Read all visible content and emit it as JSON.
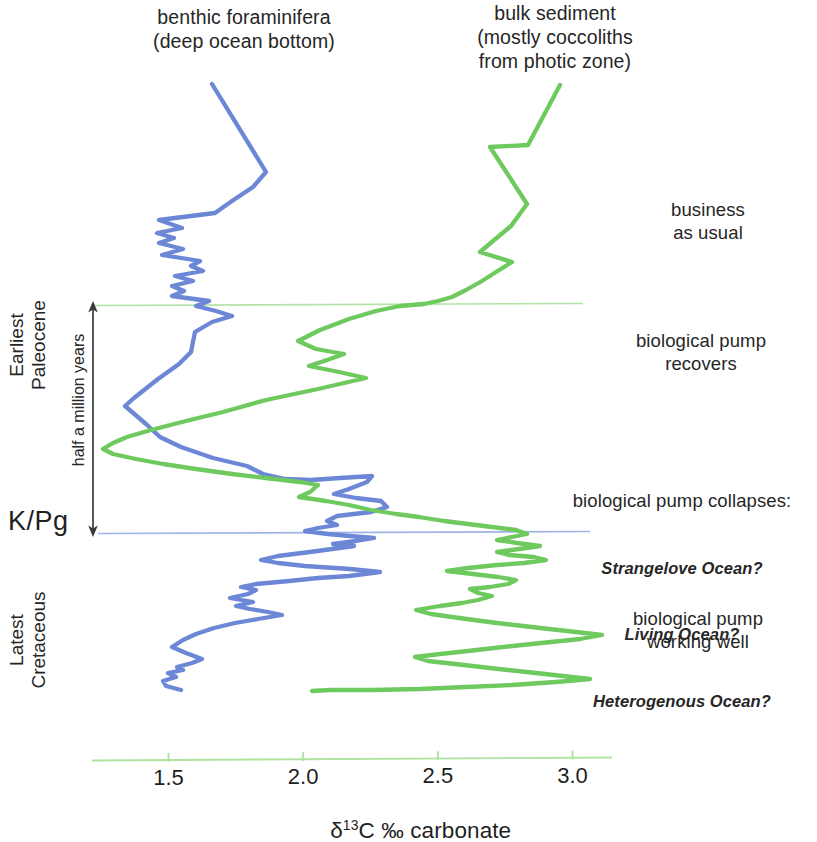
{
  "figure": {
    "title_benthic": "benthic foraminifera\n(deep ocean bottom)",
    "title_bulk": "bulk sediment\n(mostly coccoliths\nfrom photic zone)"
  },
  "axis": {
    "x_title_prefix": "δ",
    "x_title_sup": "13",
    "x_title_suffix": "C ‰ carbonate",
    "x_title_full": "δ13C ‰ carbonate",
    "ticks": [
      "1.5",
      "2.0",
      "2.5",
      "3.0"
    ],
    "tick_values": [
      1.5,
      2.0,
      2.5,
      3.0
    ],
    "axis_color": "#aee3a0"
  },
  "strat_labels": {
    "paleocene": "Earliest\nPaleocene",
    "cretaceous": "Latest\nCretaceous",
    "kpg": "K/Pg",
    "duration": "half a million years"
  },
  "annotations": {
    "business": "business\nas usual",
    "recovers": "biological pump\nrecovers",
    "collapse_head": "biological pump collapses:",
    "collapse_options": [
      "Strangelove Ocean?",
      "Living Ocean?",
      "Heterogenous Ocean?"
    ],
    "working": "biological pump\nworking well"
  },
  "colors": {
    "benthic": "#6c87d6",
    "bulk": "#6ec95f",
    "kpg_line": "#9fb4e6",
    "top_line": "#b2e3a6",
    "arrow": "#3a3a3a",
    "text": "#262626"
  },
  "chart_data": {
    "type": "line",
    "xlabel": "δ13C ‰ carbonate",
    "ylabel": "stratigraphic height (time)",
    "orientation": "vertical-stratigraphic",
    "xlim": [
      1.18,
      3.22
    ],
    "grid": false,
    "legend": "in-figure captions above each curve",
    "x_ticks": [
      1.5,
      2.0,
      2.5,
      3.0
    ],
    "reference_lines": [
      {
        "name": "K/Pg boundary",
        "y_label": "K/Pg",
        "color": "#9fb4e6",
        "x_from": 1.26,
        "x_to": 3.2
      },
      {
        "name": "end of recovery interval",
        "color": "#b2e3a6",
        "x_from": 1.21,
        "x_to": 3.11
      }
    ],
    "interval_marker": {
      "label": "half a million years",
      "from": "K/Pg boundary",
      "to": "end of recovery interval"
    },
    "series": [
      {
        "name": "benthic foraminifera (deep ocean bottom)",
        "color": "#6c87d6",
        "points_px": [
          [
            212,
            84
          ],
          [
            266,
            172
          ],
          [
            253,
            187
          ],
          [
            232,
            201
          ],
          [
            215,
            213
          ],
          [
            159,
            220
          ],
          [
            182,
            228
          ],
          [
            157,
            233
          ],
          [
            174,
            238
          ],
          [
            159,
            243
          ],
          [
            183,
            249
          ],
          [
            162,
            255
          ],
          [
            200,
            261
          ],
          [
            191,
            266
          ],
          [
            203,
            271
          ],
          [
            175,
            276
          ],
          [
            193,
            281
          ],
          [
            172,
            286
          ],
          [
            184,
            291
          ],
          [
            172,
            296
          ],
          [
            209,
            301
          ],
          [
            196,
            306
          ],
          [
            216,
            311
          ],
          [
            232,
            316
          ],
          [
            212,
            322
          ],
          [
            195,
            332
          ],
          [
            191,
            352
          ],
          [
            179,
            364
          ],
          [
            158,
            379
          ],
          [
            134,
            398
          ],
          [
            125,
            406
          ],
          [
            146,
            424
          ],
          [
            160,
            437
          ],
          [
            181,
            447
          ],
          [
            213,
            458
          ],
          [
            247,
            466
          ],
          [
            263,
            474
          ],
          [
            285,
            479
          ],
          [
            311,
            480
          ],
          [
            340,
            478
          ],
          [
            372,
            476
          ],
          [
            367,
            482
          ],
          [
            349,
            489
          ],
          [
            334,
            494
          ],
          [
            356,
            498
          ],
          [
            381,
            501
          ],
          [
            387,
            507
          ],
          [
            371,
            512
          ],
          [
            337,
            516
          ],
          [
            327,
            521
          ],
          [
            337,
            525
          ],
          [
            318,
            528
          ],
          [
            305,
            531
          ],
          [
            328,
            534
          ],
          [
            350,
            536
          ],
          [
            374,
            538
          ],
          [
            356,
            541
          ],
          [
            333,
            544
          ],
          [
            354,
            546
          ],
          [
            332,
            549
          ],
          [
            310,
            552
          ],
          [
            278,
            556
          ],
          [
            261,
            560
          ],
          [
            278,
            563
          ],
          [
            305,
            566
          ],
          [
            350,
            569
          ],
          [
            380,
            572
          ],
          [
            349,
            576
          ],
          [
            318,
            578
          ],
          [
            289,
            581
          ],
          [
            256,
            584
          ],
          [
            241,
            587
          ],
          [
            256,
            590
          ],
          [
            248,
            594
          ],
          [
            230,
            598
          ],
          [
            253,
            602
          ],
          [
            236,
            606
          ],
          [
            250,
            609
          ],
          [
            268,
            612
          ],
          [
            282,
            615
          ],
          [
            258,
            619
          ],
          [
            235,
            623
          ],
          [
            214,
            628
          ],
          [
            196,
            634
          ],
          [
            183,
            640
          ],
          [
            172,
            647
          ],
          [
            186,
            653
          ],
          [
            202,
            659
          ],
          [
            192,
            663
          ],
          [
            177,
            667
          ],
          [
            183,
            670
          ],
          [
            168,
            673
          ],
          [
            176,
            677
          ],
          [
            163,
            681
          ],
          [
            166,
            686
          ],
          [
            181,
            690
          ]
        ],
        "n_points": 96
      },
      {
        "name": "bulk sediment (mostly coccoliths from photic zone)",
        "color": "#6ec95f",
        "points_px": [
          [
            560,
            85
          ],
          [
            528,
            145
          ],
          [
            490,
            147
          ],
          [
            527,
            204
          ],
          [
            511,
            226
          ],
          [
            493,
            241
          ],
          [
            480,
            252
          ],
          [
            512,
            262
          ],
          [
            496,
            272
          ],
          [
            482,
            281
          ],
          [
            466,
            290
          ],
          [
            452,
            297
          ],
          [
            438,
            301
          ],
          [
            424,
            304
          ],
          [
            400,
            306
          ],
          [
            376,
            311
          ],
          [
            349,
            319
          ],
          [
            320,
            330
          ],
          [
            298,
            341
          ],
          [
            316,
            349
          ],
          [
            344,
            354
          ],
          [
            327,
            360
          ],
          [
            309,
            366
          ],
          [
            339,
            372
          ],
          [
            366,
            378
          ],
          [
            318,
            389
          ],
          [
            266,
            400
          ],
          [
            223,
            412
          ],
          [
            186,
            421
          ],
          [
            151,
            430
          ],
          [
            127,
            437
          ],
          [
            113,
            443
          ],
          [
            103,
            449
          ],
          [
            113,
            454
          ],
          [
            136,
            459
          ],
          [
            163,
            464
          ],
          [
            196,
            469
          ],
          [
            232,
            474
          ],
          [
            266,
            478
          ],
          [
            300,
            482
          ],
          [
            318,
            485
          ],
          [
            310,
            492
          ],
          [
            299,
            497
          ],
          [
            326,
            501
          ],
          [
            349,
            505
          ],
          [
            371,
            510
          ],
          [
            396,
            514
          ],
          [
            419,
            517
          ],
          [
            444,
            521
          ],
          [
            468,
            524
          ],
          [
            492,
            527
          ],
          [
            516,
            530
          ],
          [
            527,
            534
          ],
          [
            512,
            537
          ],
          [
            497,
            540
          ],
          [
            517,
            543
          ],
          [
            540,
            546
          ],
          [
            519,
            549
          ],
          [
            497,
            552
          ],
          [
            509,
            555
          ],
          [
            534,
            557
          ],
          [
            546,
            560
          ],
          [
            524,
            563
          ],
          [
            497,
            565
          ],
          [
            468,
            568
          ],
          [
            447,
            571
          ],
          [
            473,
            574
          ],
          [
            498,
            577
          ],
          [
            516,
            580
          ],
          [
            508,
            584
          ],
          [
            490,
            587
          ],
          [
            470,
            589
          ],
          [
            478,
            593
          ],
          [
            492,
            596
          ],
          [
            478,
            600
          ],
          [
            462,
            603
          ],
          [
            440,
            606
          ],
          [
            416,
            610
          ],
          [
            431,
            614
          ],
          [
            452,
            617
          ],
          [
            474,
            620
          ],
          [
            497,
            623
          ],
          [
            523,
            626
          ],
          [
            549,
            629
          ],
          [
            576,
            632
          ],
          [
            602,
            635
          ],
          [
            580,
            639
          ],
          [
            551,
            642
          ],
          [
            522,
            645
          ],
          [
            494,
            648
          ],
          [
            468,
            651
          ],
          [
            440,
            654
          ],
          [
            415,
            657
          ],
          [
            428,
            661
          ],
          [
            455,
            664
          ],
          [
            481,
            667
          ],
          [
            508,
            670
          ],
          [
            536,
            673
          ],
          [
            563,
            676
          ],
          [
            590,
            679
          ],
          [
            556,
            682
          ],
          [
            512,
            685
          ],
          [
            466,
            687
          ],
          [
            420,
            689
          ],
          [
            372,
            690
          ],
          [
            330,
            690
          ],
          [
            312,
            691
          ]
        ],
        "n_points": 107
      }
    ]
  }
}
